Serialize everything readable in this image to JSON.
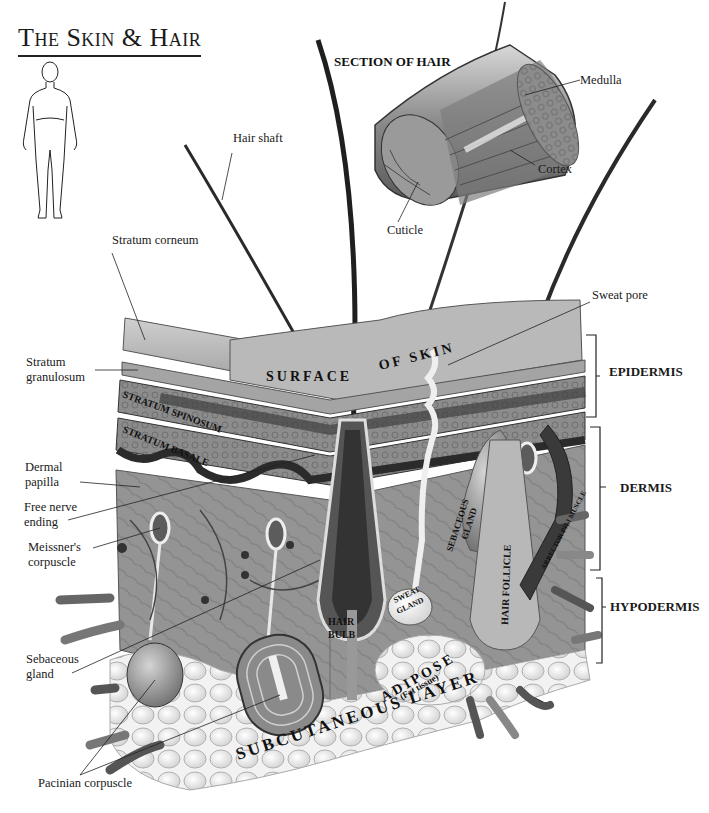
{
  "title": "The Skin & Hair",
  "section_of_hair": {
    "title": "SECTION OF HAIR",
    "labels": [
      "Medulla",
      "Cortex",
      "Cuticle"
    ]
  },
  "left_labels": {
    "hair_shaft": "Hair shaft",
    "stratum_corneum": "Stratum  corneum",
    "stratum_granulosum_1": "Stratum",
    "stratum_granulosum_2": "granulosum",
    "dermal_papilla_1": "Dermal",
    "dermal_papilla_2": "papilla",
    "free_nerve_1": "Free nerve",
    "free_nerve_2": "ending",
    "meissner_1": "Meissner's",
    "meissner_2": "corpuscle",
    "sebaceous_1": "Sebaceous",
    "sebaceous_2": "gland",
    "pacinian": "Pacinian corpuscle"
  },
  "right_labels": {
    "sweat_pore": "Sweat pore"
  },
  "layers": [
    {
      "name": "EPIDERMIS"
    },
    {
      "name": "DERMIS"
    },
    {
      "name": "HYPODERMIS"
    }
  ],
  "inlay_text": {
    "surface": "SURFACE",
    "of_skin": "OF SKIN",
    "stratum_spinosum": "STRATUM SPINOSUM",
    "stratum_basale": "STRATUM BASALE",
    "sebaceous_gland_1": "SEBACEOUS",
    "sebaceous_gland_2": "GLAND",
    "hair_follicle": "HAIR FOLLICLE",
    "arrector_pili": "ARRECTOR PILI MUSCLE",
    "sweat_gland_1": "SWEAT",
    "sweat_gland_2": "GLAND",
    "hair_bulb_1": "HAIR",
    "hair_bulb_2": "BULB",
    "adipose": "ADIPOSE",
    "fat_tissue": "(Fat tissue)",
    "subcutaneous_layer": "SUBCUTANEOUS LAYER"
  },
  "colors": {
    "background": "#ffffff",
    "epidermis_light": "#b8b8b8",
    "epidermis_dark": "#4a4a4a",
    "dermis": "#8e8e8e",
    "adipose": "#e8e8e8",
    "ink": "#111111"
  }
}
